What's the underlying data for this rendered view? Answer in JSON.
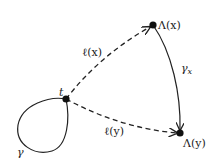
{
  "diagram": {
    "type": "directed-graph",
    "colors": {
      "stroke": "#222222",
      "node": "#111111",
      "background": "#ffffff"
    },
    "nodes": [
      {
        "id": "t",
        "label": "t",
        "x": 66,
        "y": 99
      },
      {
        "id": "Lx",
        "label": "Λ(x)",
        "x": 153,
        "y": 25
      },
      {
        "id": "Ly",
        "label": "Λ(y)",
        "x": 180,
        "y": 133
      }
    ],
    "edges": [
      {
        "id": "lx",
        "from": "t",
        "to": "Lx",
        "style": "dashed",
        "label": "ℓ(x)"
      },
      {
        "id": "ly",
        "from": "t",
        "to": "Ly",
        "style": "dashed",
        "label": "ℓ(y)"
      },
      {
        "id": "gx",
        "from": "Lx",
        "to": "Ly",
        "style": "solid",
        "label": "γ",
        "label_sub": "x"
      },
      {
        "id": "loop",
        "from": "t",
        "to": "t",
        "style": "solid",
        "label": "γ"
      }
    ]
  }
}
